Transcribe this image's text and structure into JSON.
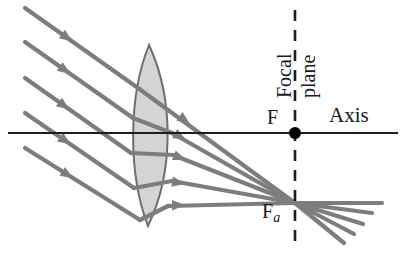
{
  "figure": {
    "type": "ray-diagram",
    "background_color": "#ffffff",
    "width": 403,
    "height": 261
  },
  "labels": {
    "axis": "Axis",
    "focal_point": "F",
    "off_axis_focal_point": "F",
    "off_axis_focal_subscript": "a",
    "focal_plane_word1": "Focal",
    "focal_plane_word2": "plane"
  },
  "colors": {
    "ray": "#7d7d7d",
    "axis": "#1d1d1d",
    "lens_fill": "#d4d4d4",
    "lens_stroke": "#6e6e6e",
    "dashed_line": "#1d1d1d",
    "text": "#1a1a1a",
    "focal_dot": "#000000"
  },
  "geometry": {
    "axis": {
      "x1": 8,
      "y": 133,
      "x2": 398
    },
    "focal_dot": {
      "cx": 295,
      "cy": 133,
      "r": 6
    },
    "focal_plane_line": {
      "x": 295,
      "y1": 10,
      "y2": 246,
      "dash": "11,9"
    },
    "lens": {
      "top_vertex": {
        "x": 149,
        "y": 45
      },
      "bottom_vertex": {
        "x": 148,
        "y": 226
      },
      "left_bulge_x": 128,
      "right_bulge_x": 174
    },
    "convergence_point": {
      "x": 295,
      "y": 203
    },
    "incoming_rays": [
      {
        "start_x": 25,
        "start_y": 8,
        "lens_x": 138,
        "lens_y": 88,
        "arrow_t": 0.42
      },
      {
        "start_x": 25,
        "start_y": 42,
        "lens_x": 133,
        "lens_y": 118,
        "arrow_t": 0.42
      },
      {
        "start_x": 25,
        "start_y": 78,
        "lens_x": 131,
        "lens_y": 153,
        "arrow_t": 0.42
      },
      {
        "start_x": 25,
        "start_y": 113,
        "lens_x": 134,
        "lens_y": 188,
        "arrow_t": 0.42
      },
      {
        "start_x": 25,
        "start_y": 148,
        "lens_x": 140,
        "lens_y": 220,
        "arrow_t": 0.42
      }
    ],
    "refracted_rays": [
      {
        "lens_x": 168,
        "lens_y": 110,
        "arrow_x": 190,
        "arrow_y": 124
      },
      {
        "lens_x": 172,
        "lens_y": 133,
        "arrow_x": 186,
        "arrow_y": 140
      },
      {
        "lens_x": 173,
        "lens_y": 155,
        "arrow_x": 186,
        "arrow_y": 160
      },
      {
        "lens_x": 172,
        "lens_y": 181,
        "arrow_x": 185,
        "arrow_y": 184
      },
      {
        "lens_x": 168,
        "lens_y": 206,
        "arrow_x": 185,
        "arrow_y": 205
      }
    ],
    "diverging_rays": [
      {
        "end_x": 382,
        "end_y": 203
      },
      {
        "end_x": 372,
        "end_y": 213
      },
      {
        "end_x": 363,
        "end_y": 224
      },
      {
        "end_x": 354,
        "end_y": 234
      },
      {
        "end_x": 344,
        "end_y": 243
      }
    ]
  }
}
